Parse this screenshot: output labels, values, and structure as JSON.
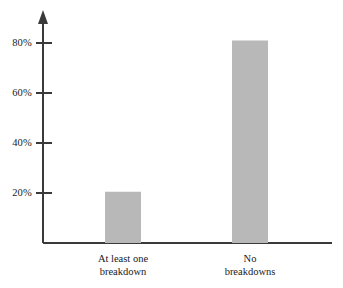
{
  "chart_data": {
    "type": "bar",
    "title": "",
    "subtitle": "",
    "xlabel": "",
    "ylabel": "",
    "categories": [
      "At least one breakdown",
      "No breakdowns"
    ],
    "category_lines": [
      [
        "At least one",
        "breakdown"
      ],
      [
        "No",
        "breakdowns"
      ]
    ],
    "values": [
      20.5,
      81
    ],
    "value_labels": [
      "",
      ""
    ],
    "ylim": [
      0,
      90
    ],
    "yticks": [
      20,
      40,
      60,
      80
    ],
    "ytick_labels": [
      "20%",
      "40%",
      "60%",
      "80%"
    ],
    "grid": false,
    "legend": false,
    "legend_position": "none",
    "series": [
      {
        "name": "Proportion",
        "values": [
          20.5,
          81
        ]
      }
    ]
  },
  "style": {
    "bar_color": "#b8b8b8",
    "axis_color": "#3a3a3a",
    "background_color": "#ffffff",
    "text_color": "#1a1a1a"
  },
  "axes": {
    "y_axis_name": "y-axis",
    "x_axis_name": "x-axis",
    "y_axis_has_arrow": true,
    "x_axis_has_arrow": false
  }
}
